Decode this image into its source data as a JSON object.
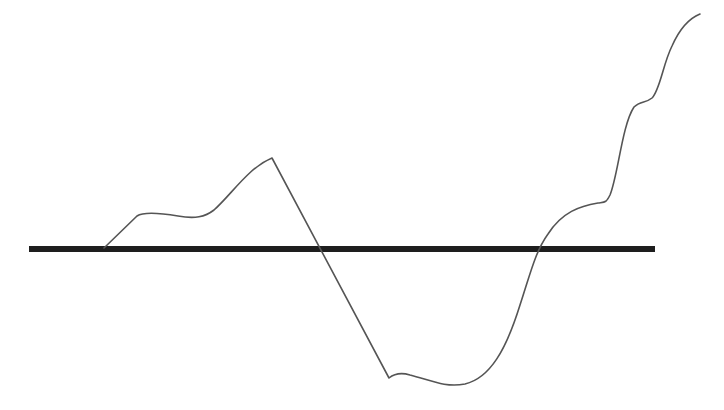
{
  "diagram": {
    "colors": {
      "background": "#ffffff",
      "baseline": "#1e1e1e",
      "curve": "#555555"
    },
    "baseline": {
      "x1": 29,
      "x2": 655,
      "y": 249,
      "thickness": 6
    },
    "curve": {
      "stroke_width": 1.6,
      "path": "M104,248 L137,216 C143,212 160,213 178,216 C195,219 205,217 214,210 C232,194 248,168 272,158 L389,378 C394,374 400,372 410,375 C430,380 445,388 465,384 C490,378 506,350 520,305 C530,275 535,252 548,234 C562,212 580,206 598,203 C605,202 606,203 610,195 C618,176 622,125 634,107 C640,101 646,103 652,98 C660,90 663,64 672,46 C680,28 690,18 700,14"
    }
  }
}
